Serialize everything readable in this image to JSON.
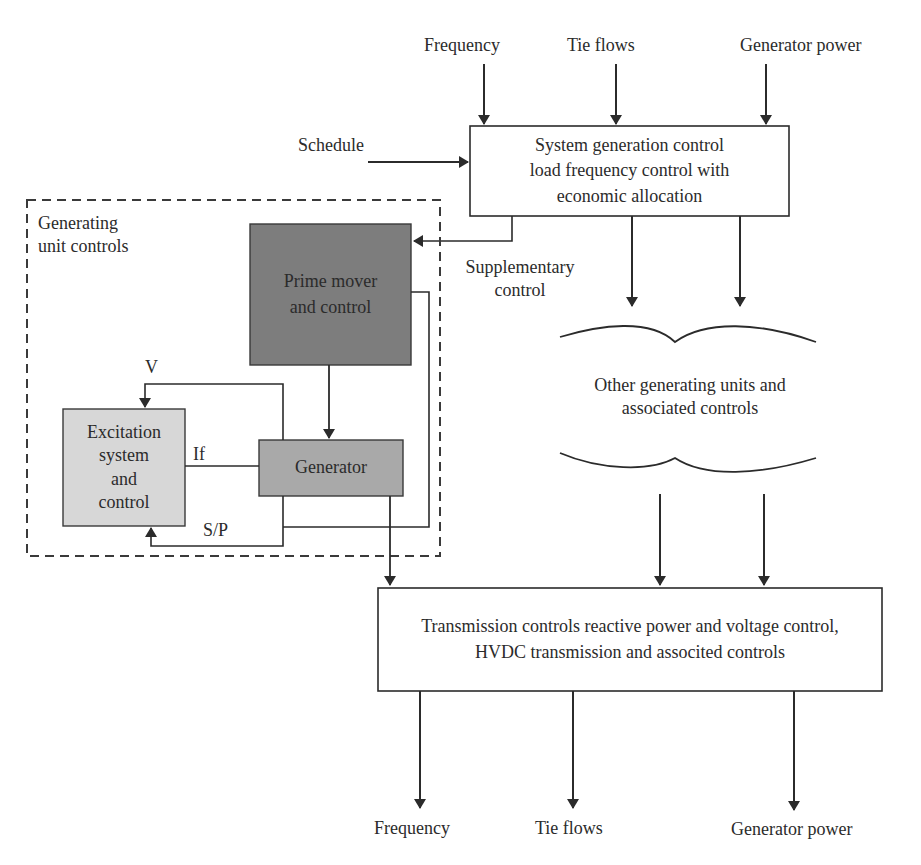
{
  "colors": {
    "line": "#2b2b2b",
    "box_white": "#ffffff",
    "prime_mover_fill": "#7d7d7d",
    "generator_fill": "#a9a9a9",
    "excitation_fill": "#d7d7d7",
    "dashed_border": "#3a3a3a"
  },
  "inputs_top": {
    "frequency": "Frequency",
    "tie_flows": "Tie flows",
    "generator_power": "Generator power",
    "schedule": "Schedule"
  },
  "system_generation_control": {
    "line1": "System generation control",
    "line2": "load frequency control with",
    "line3": "economic allocation"
  },
  "supplementary_control": {
    "line1": "Supplementary",
    "line2": "control"
  },
  "generating_unit_controls": {
    "title_line1": "Generating",
    "title_line2": "unit controls",
    "prime_mover": {
      "line1": "Prime mover",
      "line2": "and control"
    },
    "generator": "Generator",
    "excitation": {
      "line1": "Excitation",
      "line2": "system",
      "line3": "and",
      "line4": "control"
    },
    "signals": {
      "v": "V",
      "if": "If",
      "sp": "S/P"
    }
  },
  "other_units": {
    "line1": "Other generating units and",
    "line2": "associated controls"
  },
  "transmission_controls": {
    "line1": "Transmission controls reactive power and voltage control,",
    "line2": "HVDC transmission and associted controls"
  },
  "outputs_bottom": {
    "frequency": "Frequency",
    "tie_flows": "Tie flows",
    "generator_power": "Generator power"
  }
}
